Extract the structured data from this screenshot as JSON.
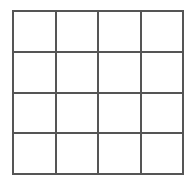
{
  "figure": {
    "name": "4x4 grid",
    "type": "grid",
    "background_color": "#ffffff",
    "line_color": "#555555",
    "line_width_px": 2,
    "bounds": {
      "left_px": 12,
      "top_px": 10,
      "right_px": 184,
      "bottom_px": 175,
      "width_px": 172,
      "height_px": 165
    },
    "rows": 4,
    "columns": 4,
    "cell_count": 16,
    "vertical_line_x_px": [
      12,
      55,
      98,
      141,
      184
    ],
    "horizontal_line_y_px": [
      10,
      51,
      93,
      134,
      175
    ],
    "grid": [
      [
        {
          "label": "",
          "row": 1,
          "column": 1
        },
        {
          "label": "",
          "row": 1,
          "column": 2
        },
        {
          "label": "",
          "row": 1,
          "column": 3
        },
        {
          "label": "",
          "row": 1,
          "column": 4
        }
      ],
      [
        {
          "label": "",
          "row": 2,
          "column": 1
        },
        {
          "label": "",
          "row": 2,
          "column": 2
        },
        {
          "label": "",
          "row": 2,
          "column": 3
        },
        {
          "label": "",
          "row": 2,
          "column": 4
        }
      ],
      [
        {
          "label": "",
          "row": 3,
          "column": 1
        },
        {
          "label": "",
          "row": 3,
          "column": 2
        },
        {
          "label": "",
          "row": 3,
          "column": 3
        },
        {
          "label": "",
          "row": 3,
          "column": 4
        }
      ],
      [
        {
          "label": "",
          "row": 4,
          "column": 1
        },
        {
          "label": "",
          "row": 4,
          "column": 2
        },
        {
          "label": "",
          "row": 4,
          "column": 3
        },
        {
          "label": "",
          "row": 4,
          "column": 4
        }
      ]
    ]
  }
}
